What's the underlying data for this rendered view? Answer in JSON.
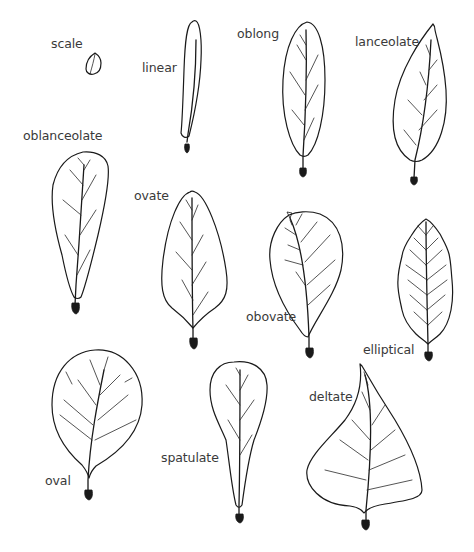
{
  "ink_color": "#1a1a1a",
  "label_color": "#3a3a3a",
  "leaves": [
    {
      "id": "scale",
      "label": "scale"
    },
    {
      "id": "linear",
      "label": "linear"
    },
    {
      "id": "oblong",
      "label": "oblong"
    },
    {
      "id": "lanceolate",
      "label": "lanceolate"
    },
    {
      "id": "oblanceolate",
      "label": "oblanceolate"
    },
    {
      "id": "ovate",
      "label": "ovate"
    },
    {
      "id": "obovate",
      "label": "obovate"
    },
    {
      "id": "elliptical",
      "label": "elliptical"
    },
    {
      "id": "oval",
      "label": "oval"
    },
    {
      "id": "spatulate",
      "label": "spatulate"
    },
    {
      "id": "deltate",
      "label": "deltate"
    }
  ]
}
